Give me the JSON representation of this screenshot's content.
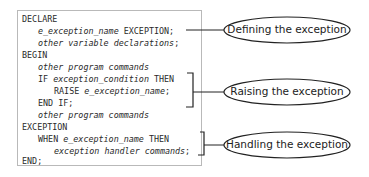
{
  "code": {
    "lines": [
      {
        "kw": "DECLARE",
        "it": "",
        "rest": ""
      },
      {
        "kw": "",
        "it": "e_exception_name",
        "rest": " EXCEPTION;"
      },
      {
        "kw": "",
        "it": "other variable declarations",
        "rest": ";"
      },
      {
        "kw": "BEGIN",
        "it": "",
        "rest": ""
      },
      {
        "kw": "",
        "it": "other program commands",
        "rest": ""
      },
      {
        "kw": "IF ",
        "it": "exception_condition",
        "rest": " THEN"
      },
      {
        "kw": "RAISE ",
        "it": "e_exception_name",
        "rest": ";"
      },
      {
        "kw": "END IF;",
        "it": "",
        "rest": ""
      },
      {
        "kw": "",
        "it": "other program commands",
        "rest": ""
      },
      {
        "kw": "EXCEPTION",
        "it": "",
        "rest": ""
      },
      {
        "kw": "WHEN ",
        "it": "e_exception_name",
        "rest": " THEN"
      },
      {
        "kw": "",
        "it": "exception handler commands",
        "rest": ";"
      },
      {
        "kw": "END;",
        "it": "",
        "rest": ""
      }
    ]
  },
  "callouts": {
    "defining": "Defining the exception",
    "raising": "Raising the exception",
    "handling": "Handling the exception"
  }
}
